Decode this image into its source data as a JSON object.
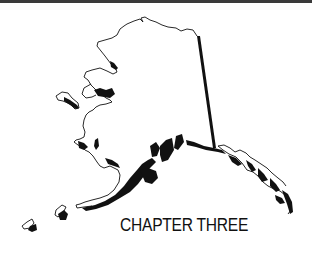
{
  "page": {
    "chapter_title": "CHAPTER THREE",
    "illustration": "alaska-outline-map",
    "colors": {
      "ink": "#111111",
      "rule": "#3a3a3a",
      "background": "#ffffff"
    }
  }
}
